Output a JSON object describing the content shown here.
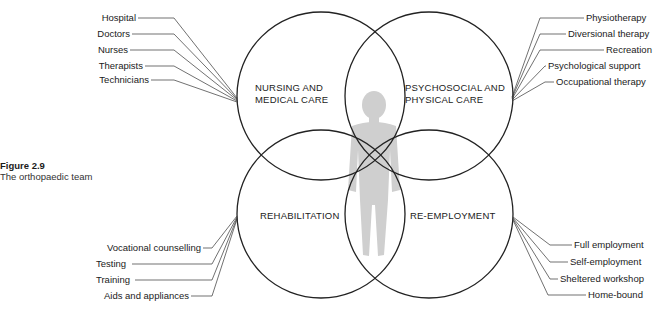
{
  "caption": {
    "figure_number": "Figure 2.9",
    "title": "The orthopaedic team"
  },
  "circles": {
    "nursing": {
      "line1": "NURSING AND",
      "line2": "MEDICAL CARE"
    },
    "psychosocial": {
      "line1": "PSYCHOSOCIAL AND",
      "line2": "PHYSICAL CARE"
    },
    "rehabilitation": {
      "line1": "REHABILITATION"
    },
    "reemployment": {
      "line1": "RE-EMPLOYMENT"
    }
  },
  "labels": {
    "nursing": [
      "Hospital",
      "Doctors",
      "Nurses",
      "Therapists",
      "Technicians"
    ],
    "psychosocial": [
      "Physiotherapy",
      "Diversional therapy",
      "Recreation",
      "Psychological support",
      "Occupational therapy"
    ],
    "rehabilitation": [
      "Vocational counselling",
      "Testing",
      "Training",
      "Aids and appliances"
    ],
    "reemployment": [
      "Full employment",
      "Self-employment",
      "Sheltered workshop",
      "Home-bound"
    ]
  },
  "center_figure": "human-silhouette",
  "colors": {
    "stroke": "#222222",
    "figure": "#c8c8c8"
  }
}
